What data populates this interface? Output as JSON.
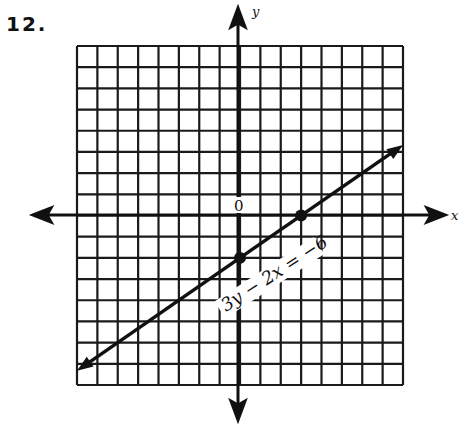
{
  "problem": {
    "number": "12."
  },
  "graph": {
    "x_axis_label": "x",
    "y_axis_label": "y",
    "origin_label": "0",
    "equation_label": "3y − 2x = −6",
    "grid": {
      "cells_x": 16,
      "cells_y": 16,
      "xmin": -8,
      "xmax": 8,
      "ymin": -8,
      "ymax": 8,
      "unit": 1
    },
    "colors": {
      "ink": "#111111",
      "paper": "#ffffff"
    }
  },
  "chart_data": {
    "type": "line",
    "title": "",
    "xlabel": "x",
    "ylabel": "y",
    "xlim": [
      -8,
      8
    ],
    "ylim": [
      -8,
      8
    ],
    "grid": true,
    "series": [
      {
        "name": "3y − 2x = −6",
        "equation": "3y - 2x = -6",
        "slope": 0.6667,
        "y_intercept": -2,
        "x_intercept": 3,
        "marked_points": [
          [
            0,
            -2
          ],
          [
            3,
            0
          ]
        ],
        "endpoints": [
          [
            -8,
            -7.33
          ],
          [
            8,
            3.33
          ]
        ],
        "arrows_both_ends": true
      }
    ],
    "annotations": [
      "0",
      "3y − 2x = −6"
    ]
  }
}
